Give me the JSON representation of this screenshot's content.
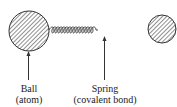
{
  "diagram": {
    "labels": {
      "ball": {
        "line1": "Ball",
        "line2": "(atom)"
      },
      "spring": {
        "line1": "Spring",
        "line2": "(covalent bond)"
      }
    },
    "colors": {
      "stroke": "#333333",
      "background": "#ffffff"
    }
  }
}
